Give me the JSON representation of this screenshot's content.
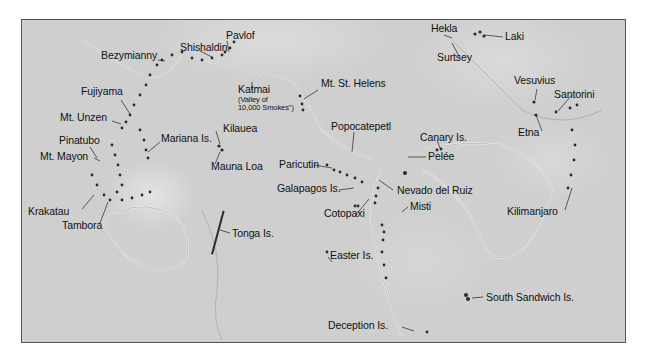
{
  "map": {
    "type": "shaded-relief world map",
    "colors": {
      "background": "#cfcfcf",
      "volcano_marks": "#222222",
      "frame": "#555555",
      "label_text": "#111111"
    },
    "volcanoes": [
      {
        "id": "bezymianny",
        "label": "Bezymianny"
      },
      {
        "id": "shishaldin",
        "label": "Shishaldin"
      },
      {
        "id": "pavlof",
        "label": "Pavlof"
      },
      {
        "id": "katmai",
        "label": "Katmai",
        "sublabel_1": "(Valley of",
        "sublabel_2": "10,000 Smokes\")"
      },
      {
        "id": "mt-st-helens",
        "label": "Mt. St. Helens"
      },
      {
        "id": "fujiyama",
        "label": "Fujiyama"
      },
      {
        "id": "mt-unzen",
        "label": "Mt. Unzen"
      },
      {
        "id": "mariana-is",
        "label": "Mariana Is."
      },
      {
        "id": "kilauea",
        "label": "Kilauea"
      },
      {
        "id": "pinatubo",
        "label": "Pinatubo"
      },
      {
        "id": "mt-mayon",
        "label": "Mt. Mayon"
      },
      {
        "id": "mauna-loa",
        "label": "Mauna Loa"
      },
      {
        "id": "popocatepetl",
        "label": "Popocatepetl"
      },
      {
        "id": "paricutin",
        "label": "Paricutin"
      },
      {
        "id": "hekla",
        "label": "Hekla"
      },
      {
        "id": "laki",
        "label": "Laki"
      },
      {
        "id": "surtsey",
        "label": "Surtsey"
      },
      {
        "id": "vesuvius",
        "label": "Vesuvius"
      },
      {
        "id": "santorini",
        "label": "Santorini"
      },
      {
        "id": "canary-is",
        "label": "Canary Is."
      },
      {
        "id": "etna",
        "label": "Etna"
      },
      {
        "id": "pelee",
        "label": "Pelée"
      },
      {
        "id": "galapagos-is",
        "label": "Galapagos Is."
      },
      {
        "id": "nevado-del-ruiz",
        "label": "Nevado del Ruiz"
      },
      {
        "id": "cotopaxi",
        "label": "Cotopaxi"
      },
      {
        "id": "misti",
        "label": "Misti"
      },
      {
        "id": "kilimanjaro",
        "label": "Kilimanjaro"
      },
      {
        "id": "krakatau",
        "label": "Krakatau"
      },
      {
        "id": "tambora",
        "label": "Tambora"
      },
      {
        "id": "tonga-is",
        "label": "Tonga Is."
      },
      {
        "id": "easter-is",
        "label": "Easter Is."
      },
      {
        "id": "south-sandwich-is",
        "label": "South Sandwich Is."
      },
      {
        "id": "deception-is",
        "label": "Deception Is."
      }
    ]
  }
}
